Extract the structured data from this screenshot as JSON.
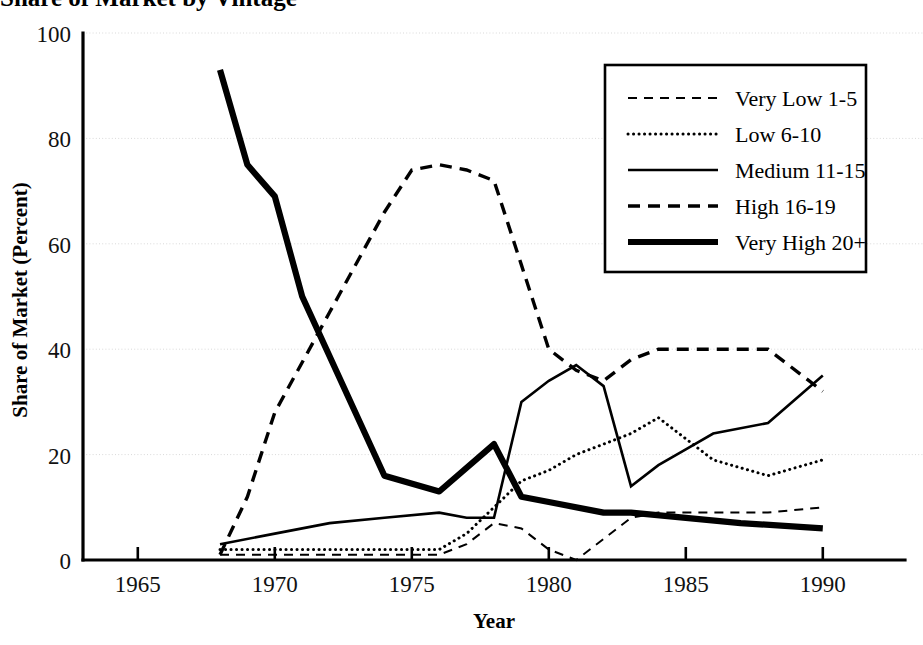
{
  "figure": {
    "title_clipped": "Share of Market by Vintage",
    "background": "#ffffff",
    "ink_color": "#000000",
    "gridline_color": "#d9d9d9"
  },
  "axes": {
    "x_title": "Year",
    "y_title": "Share of Market (Percent)",
    "x_ticks": [
      "1965",
      "1970",
      "1975",
      "1980",
      "1985",
      "1990"
    ],
    "y_ticks": [
      "0",
      "20",
      "40",
      "60",
      "80",
      "100"
    ]
  },
  "legend": {
    "entries": [
      {
        "label": "Very Low 1-5",
        "style": "thin-dashed"
      },
      {
        "label": "Low 6-10",
        "style": "dotted"
      },
      {
        "label": "Medium 11-15",
        "style": "thin-solid"
      },
      {
        "label": "High 16-19",
        "style": "dashed"
      },
      {
        "label": "Very High 20+",
        "style": "thick-solid"
      }
    ]
  },
  "chart_data": {
    "type": "line",
    "title": "Share of Market by Vintage",
    "xlabel": "Year",
    "ylabel": "Share of Market (Percent)",
    "xlim": [
      1963,
      1993
    ],
    "ylim": [
      0,
      100
    ],
    "x_ticks": [
      1965,
      1970,
      1975,
      1980,
      1985,
      1990
    ],
    "y_ticks": [
      0,
      20,
      40,
      60,
      80,
      100
    ],
    "grid": "horizontal-dotted",
    "legend_position": "upper-right",
    "series": [
      {
        "name": "Very Low 1-5",
        "style": "thin-dashed",
        "x": [
          1968,
          1970,
          1972,
          1974,
          1976,
          1977,
          1978,
          1979,
          1980,
          1981,
          1982,
          1983,
          1984,
          1985,
          1986,
          1988,
          1990
        ],
        "values": [
          1,
          1,
          1,
          1,
          1,
          3,
          7,
          6,
          2,
          0,
          4,
          8,
          9,
          9,
          9,
          9,
          10
        ]
      },
      {
        "name": "Low 6-10",
        "style": "dotted",
        "x": [
          1968,
          1970,
          1972,
          1974,
          1976,
          1977,
          1978,
          1979,
          1980,
          1981,
          1982,
          1983,
          1984,
          1985,
          1986,
          1988,
          1990
        ],
        "values": [
          2,
          2,
          2,
          2,
          2,
          5,
          10,
          15,
          17,
          20,
          22,
          24,
          27,
          23,
          19,
          16,
          19
        ]
      },
      {
        "name": "Medium 11-15",
        "style": "thin-solid",
        "x": [
          1968,
          1970,
          1972,
          1974,
          1976,
          1977,
          1978,
          1979,
          1980,
          1981,
          1982,
          1983,
          1984,
          1985,
          1986,
          1988,
          1990
        ],
        "values": [
          3,
          5,
          7,
          8,
          9,
          8,
          8,
          30,
          34,
          37,
          33,
          14,
          18,
          21,
          24,
          26,
          35
        ]
      },
      {
        "name": "High 16-19",
        "style": "dashed",
        "x": [
          1968,
          1969,
          1970,
          1972,
          1974,
          1975,
          1976,
          1977,
          1978,
          1979,
          1980,
          1981,
          1982,
          1983,
          1984,
          1985,
          1986,
          1988,
          1990
        ],
        "values": [
          1,
          12,
          28,
          47,
          66,
          74,
          75,
          74,
          72,
          56,
          40,
          36,
          34,
          38,
          40,
          40,
          40,
          40,
          32
        ]
      },
      {
        "name": "Very High 20+",
        "style": "thick-solid",
        "x": [
          1968,
          1969,
          1970,
          1971,
          1974,
          1976,
          1978,
          1979,
          1980,
          1982,
          1983,
          1985,
          1987,
          1990
        ],
        "values": [
          93,
          75,
          69,
          50,
          16,
          13,
          22,
          12,
          11,
          9,
          9,
          8,
          7,
          6
        ]
      }
    ]
  }
}
